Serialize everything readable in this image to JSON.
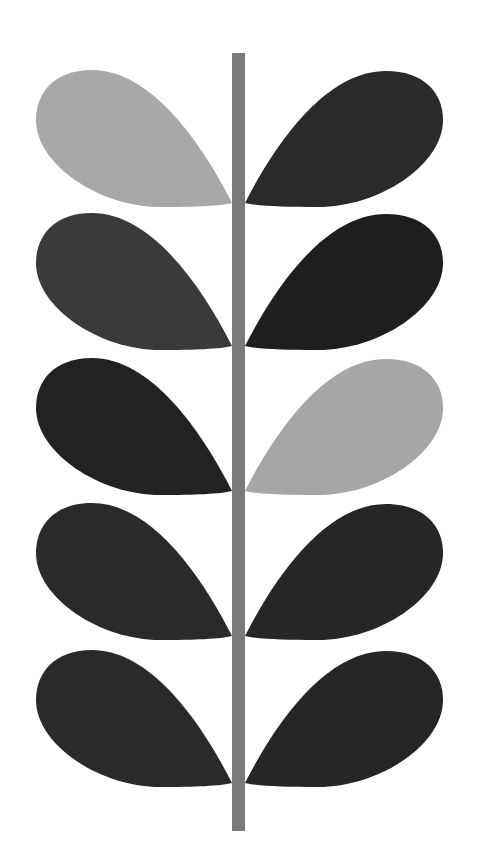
{
  "colors": {
    "background": "#ffffff",
    "stem": "#7a7a7a",
    "light": "#a8a8a8",
    "dark_grey": "#3a3a3a",
    "near_black": "#222222",
    "black": "#1c1c1c"
  },
  "stem": {
    "x": 232,
    "y": 53,
    "width": 13,
    "height": 778
  },
  "rows": [
    {
      "top": 70,
      "left_color": "#a8a8a8",
      "right_color": "#2a2a2a"
    },
    {
      "top": 213,
      "left_color": "#3a3a3a",
      "right_color": "#1e1e1e"
    },
    {
      "top": 358,
      "left_color": "#222222",
      "right_color": "#a6a6a6"
    },
    {
      "top": 503,
      "left_color": "#2a2a2a",
      "right_color": "#262626"
    },
    {
      "top": 650,
      "left_color": "#2a2a2a",
      "right_color": "#262626"
    }
  ]
}
